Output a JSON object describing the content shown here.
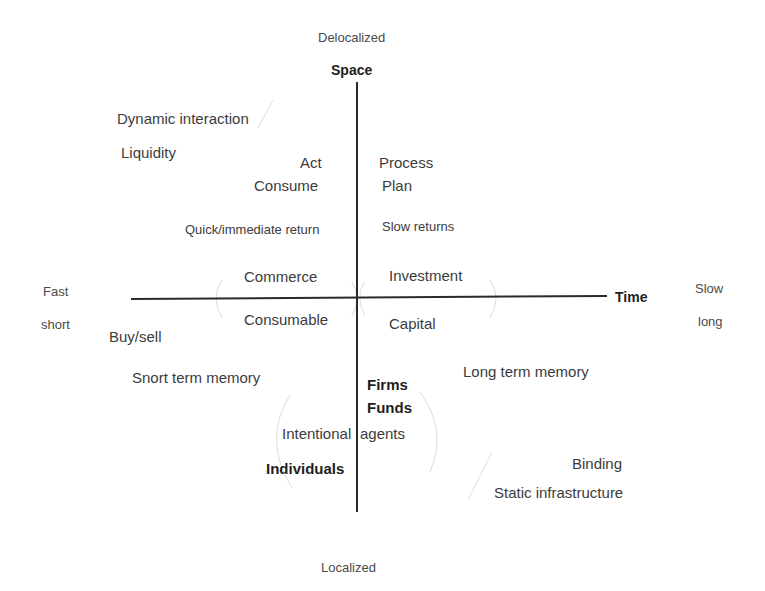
{
  "poles": {
    "top": "Delocalized",
    "bottom": "Localized",
    "left_upper": "Fast",
    "left_lower": "short",
    "right_upper": "Slow",
    "right_lower": "long"
  },
  "axes": {
    "vertical_title": "Space",
    "horizontal_title": "Time",
    "color": "#2a2a2a"
  },
  "upper_left": {
    "dynamic_interaction": "Dynamic interaction",
    "liquidity": "Liquidity",
    "act": "Act",
    "consume": "Consume",
    "quick_return": "Quick/immediate return",
    "commerce": "Commerce"
  },
  "upper_right": {
    "process": "Process",
    "plan": "Plan",
    "slow_returns": "Slow returns",
    "investment": "Investment"
  },
  "lower_left": {
    "consumable": "Consumable",
    "buy_sell": "Buy/sell",
    "short_term_memory": "Snort term memory",
    "intentional": "Intentional",
    "individuals": "Individuals"
  },
  "lower_right": {
    "capital": "Capital",
    "long_term_memory": "Long term memory",
    "firms": "Firms",
    "funds": "Funds",
    "agents": "agents",
    "binding": "Binding",
    "static_infrastructure": "Static infrastructure"
  },
  "colors": {
    "arc": "#d8d8d8",
    "text": "#3c3c3c"
  }
}
